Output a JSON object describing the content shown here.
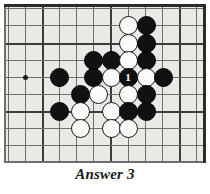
{
  "figure": {
    "kind": "go-board-diagram",
    "caption": "Answer 3",
    "board": {
      "background_color": "#e9e9e6",
      "line_color": "#6e6e6a",
      "border_color": "#2b2b2b",
      "columns_px": [
        8,
        25,
        42,
        59,
        76,
        93,
        110,
        128,
        145,
        162,
        179,
        196
      ],
      "rows_px": [
        8,
        25,
        43,
        60,
        77,
        94,
        111,
        128,
        145
      ],
      "heavy_columns_px": [
        42,
        110,
        179
      ],
      "heavy_rows_px": [
        43,
        111
      ],
      "star_point": {
        "x": 25,
        "y": 77
      }
    },
    "stones": [
      {
        "color": "white",
        "x": 128,
        "y": 25,
        "label": ""
      },
      {
        "color": "black",
        "x": 146,
        "y": 25,
        "label": ""
      },
      {
        "color": "white",
        "x": 128,
        "y": 43,
        "label": ""
      },
      {
        "color": "black",
        "x": 146,
        "y": 43,
        "label": ""
      },
      {
        "color": "black",
        "x": 93,
        "y": 60,
        "label": ""
      },
      {
        "color": "black",
        "x": 111,
        "y": 60,
        "label": ""
      },
      {
        "color": "white",
        "x": 128,
        "y": 60,
        "label": ""
      },
      {
        "color": "black",
        "x": 146,
        "y": 60,
        "label": ""
      },
      {
        "color": "black",
        "x": 59,
        "y": 77,
        "label": ""
      },
      {
        "color": "black",
        "x": 93,
        "y": 77,
        "label": ""
      },
      {
        "color": "white",
        "x": 111,
        "y": 77,
        "label": ""
      },
      {
        "color": "black",
        "x": 128,
        "y": 77,
        "label": "1"
      },
      {
        "color": "white",
        "x": 146,
        "y": 77,
        "label": ""
      },
      {
        "color": "black",
        "x": 163,
        "y": 77,
        "label": ""
      },
      {
        "color": "black",
        "x": 80,
        "y": 94,
        "label": ""
      },
      {
        "color": "white",
        "x": 98,
        "y": 94,
        "label": ""
      },
      {
        "color": "white",
        "x": 128,
        "y": 94,
        "label": ""
      },
      {
        "color": "black",
        "x": 146,
        "y": 94,
        "label": ""
      },
      {
        "color": "black",
        "x": 59,
        "y": 111,
        "label": ""
      },
      {
        "color": "white",
        "x": 80,
        "y": 111,
        "label": ""
      },
      {
        "color": "white",
        "x": 111,
        "y": 111,
        "label": ""
      },
      {
        "color": "black",
        "x": 128,
        "y": 111,
        "label": ""
      },
      {
        "color": "black",
        "x": 146,
        "y": 111,
        "label": ""
      },
      {
        "color": "white",
        "x": 80,
        "y": 128,
        "label": ""
      },
      {
        "color": "white",
        "x": 111,
        "y": 128,
        "label": ""
      },
      {
        "color": "white",
        "x": 128,
        "y": 128,
        "label": ""
      }
    ]
  }
}
